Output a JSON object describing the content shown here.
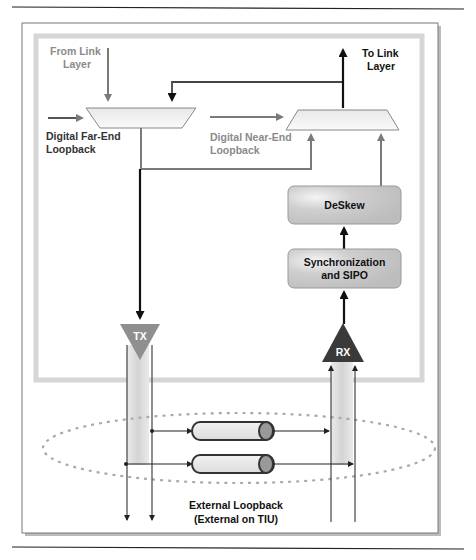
{
  "labels": {
    "from_link_layer_1": "From Link",
    "from_link_layer_2": "Layer",
    "to_link_layer_1": "To Link",
    "to_link_layer_2": "Layer",
    "far_end_1": "Digital Far-End",
    "far_end_2": "Loopback",
    "near_end_1": "Digital Near-End",
    "near_end_2": "Loopback",
    "deskew": "DeSkew",
    "sync_1": "Synchronization",
    "sync_2": "and SIPO",
    "tx": "TX",
    "rx": "RX",
    "external_1": "External Loopback",
    "external_2": "(External on TIU)"
  },
  "colors": {
    "arrow_grey": "#7a7a7a",
    "arrow_dark": "#111111",
    "tx_fill": "#8f8f8f",
    "rx_fill": "#3a3a3a",
    "box_fill": "#c8c8c8",
    "frame_border": "#d6d6d6"
  }
}
